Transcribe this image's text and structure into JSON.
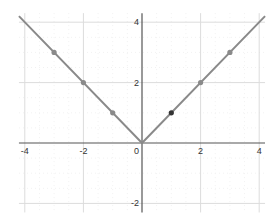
{
  "chart_data": {
    "type": "line",
    "title": "",
    "xlabel": "",
    "ylabel": "",
    "function": "y = |x|",
    "xlim": [
      -4.2,
      4.2
    ],
    "ylim": [
      -2.3,
      4.3
    ],
    "grid": true,
    "x_ticks": [
      -4,
      -2,
      2,
      4
    ],
    "y_ticks": [
      -2,
      2,
      4
    ],
    "origin_label": "0",
    "series": [
      {
        "name": "y = |x|",
        "x": [
          -4.2,
          0,
          4.2
        ],
        "y": [
          4.2,
          0,
          4.2
        ],
        "color": "#8a8a8a"
      }
    ],
    "points": [
      {
        "x": -3,
        "y": 3,
        "color": "#8a8a8a"
      },
      {
        "x": -2,
        "y": 2,
        "color": "#8a8a8a"
      },
      {
        "x": -1,
        "y": 1,
        "color": "#8a8a8a"
      },
      {
        "x": 1,
        "y": 1,
        "color": "#333333"
      },
      {
        "x": 2,
        "y": 2,
        "color": "#8a8a8a"
      },
      {
        "x": 3,
        "y": 3,
        "color": "#8a8a8a"
      }
    ]
  }
}
